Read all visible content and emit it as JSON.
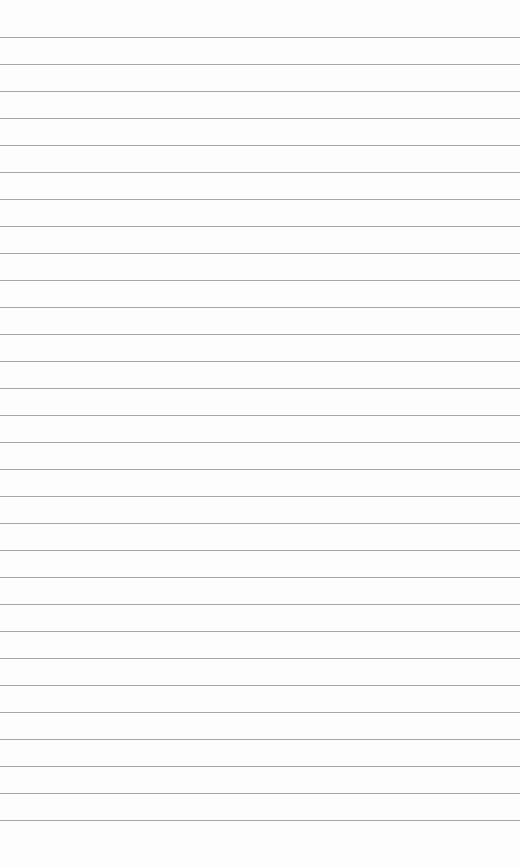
{
  "image": {
    "description": "Blank lined paper",
    "background_color": "#fdfdfd",
    "rule_color": "#8a8a8a",
    "rules": {
      "count": 30,
      "first_y": 37,
      "spacing": 27
    }
  }
}
